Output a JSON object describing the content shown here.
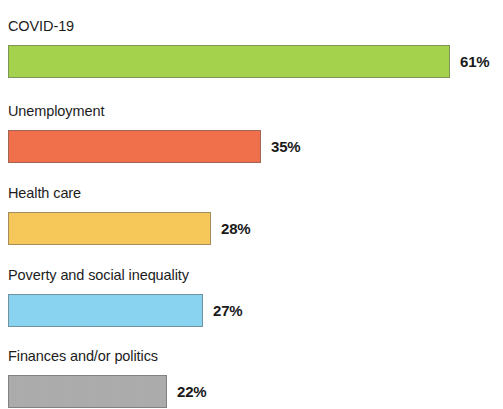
{
  "chart_data": {
    "type": "bar",
    "orientation": "horizontal",
    "title": "",
    "xlabel": "",
    "ylabel": "",
    "value_suffix": "%",
    "xlim": [
      0,
      61
    ],
    "grid": false,
    "legend": false,
    "categories": [
      "COVID-19",
      "Unemployment",
      "Health care",
      "Poverty and social inequality",
      "Finances and/or politics"
    ],
    "values": [
      61,
      35,
      28,
      27,
      22
    ],
    "value_labels": [
      "61%",
      "35%",
      "28%",
      "27%",
      "22%"
    ],
    "colors": [
      "#A6D44E",
      "#F2714C",
      "#F8C95A",
      "#8BD5F2",
      "#ADADAD"
    ],
    "bars": [
      {
        "label": "COVID-19",
        "value": 61,
        "value_label": "61%",
        "color": "#A6D44E"
      },
      {
        "label": "Unemployment",
        "value": 35,
        "value_label": "35%",
        "color": "#F2714C"
      },
      {
        "label": "Health care",
        "value": 28,
        "value_label": "28%",
        "color": "#F8C95A"
      },
      {
        "label": "Poverty and social inequality",
        "value": 27,
        "value_label": "27%",
        "color": "#8BD5F2"
      },
      {
        "label": "Finances and/or politics",
        "value": 22,
        "value_label": "22%",
        "color": "#ADADAD"
      }
    ]
  },
  "top_sliver": {
    "text": ""
  }
}
